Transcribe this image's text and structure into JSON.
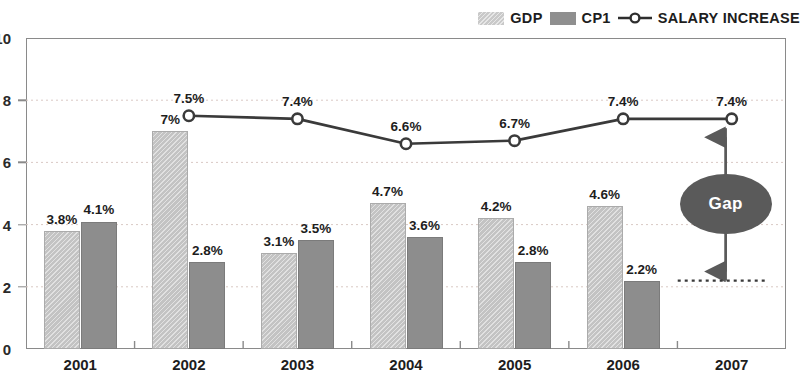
{
  "legend": {
    "items": [
      {
        "key": "gdp",
        "label": "GDP",
        "type": "swatch",
        "color": "#c9c9c9"
      },
      {
        "key": "cp1",
        "label": "CP1",
        "type": "swatch",
        "color": "#8f8f8f"
      },
      {
        "key": "salary",
        "label": "SALARY INCREASE",
        "type": "line-marker",
        "color": "#3a3a3a"
      }
    ]
  },
  "axes": {
    "y_ticks": [
      "0",
      "2",
      "4",
      "6",
      "8",
      "10"
    ],
    "x_ticks": [
      "2001",
      "2002",
      "2003",
      "2004",
      "2005",
      "2006",
      "2007"
    ]
  },
  "annotation": {
    "gap_label": "Gap",
    "gap_top_value": 7.1,
    "gap_bottom_value": 2.2,
    "reference_line_value": 2.2,
    "ellipse_color": "#5a5a5a"
  },
  "chart_data": {
    "type": "bar",
    "title": "",
    "subtitle": "",
    "xlabel": "",
    "ylabel": "",
    "ylim": [
      0,
      10
    ],
    "ytick_step": 2,
    "grid": true,
    "grid_style": "dotted",
    "legend_position": "top-right",
    "categories": [
      "2001",
      "2002",
      "2003",
      "2004",
      "2005",
      "2006",
      "2007"
    ],
    "series": [
      {
        "name": "GDP",
        "type": "bar",
        "color": "#c3c3c3",
        "values": [
          3.8,
          7.0,
          3.1,
          4.7,
          4.2,
          4.6,
          null
        ],
        "labels": [
          "3.8%",
          "7%",
          "3.1%",
          "4.7%",
          "4.2%",
          "4.6%",
          ""
        ]
      },
      {
        "name": "CP1",
        "type": "bar",
        "color": "#8d8d8d",
        "values": [
          4.1,
          2.8,
          3.5,
          3.6,
          2.8,
          2.2,
          null
        ],
        "labels": [
          "4.1%",
          "2.8%",
          "3.5%",
          "3.6%",
          "2.8%",
          "2.2%",
          ""
        ]
      },
      {
        "name": "SALARY INCREASE",
        "type": "line",
        "color": "#3a3a3a",
        "marker": "circle-open",
        "values": [
          null,
          7.5,
          7.4,
          6.6,
          6.7,
          7.4,
          7.4
        ],
        "labels": [
          "",
          "7.5%",
          "7.4%",
          "6.6%",
          "6.7%",
          "7.4%",
          "7.4%"
        ]
      }
    ]
  }
}
